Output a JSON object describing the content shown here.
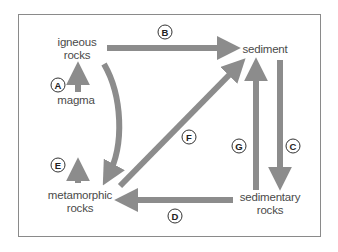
{
  "diagram": {
    "colors": {
      "arrow": "#8c8c8c",
      "frame": "#8a8a8a",
      "text": "#4a4a4a",
      "badge_border": "#333333"
    },
    "nodes": {
      "igneous": {
        "line1": "igneous",
        "line2": "rocks"
      },
      "sediment": {
        "line1": "sediment"
      },
      "magma": {
        "line1": "magma"
      },
      "metamorphic": {
        "line1": "metamorphic",
        "line2": "rocks"
      },
      "sedimentary": {
        "line1": "sedimentary",
        "line2": "rocks"
      }
    },
    "arrows": [
      {
        "label": "A",
        "from": "magma",
        "to": "igneous rocks"
      },
      {
        "label": "B",
        "from": "igneous rocks",
        "to": "sediment"
      },
      {
        "label": "C",
        "from": "sediment",
        "to": "sedimentary rocks"
      },
      {
        "label": "D",
        "from": "sedimentary rocks",
        "to": "metamorphic rocks"
      },
      {
        "label": "E",
        "from": "metamorphic rocks",
        "to": "magma"
      },
      {
        "label": "F",
        "from": "metamorphic rocks",
        "to": "sediment"
      },
      {
        "label": "G",
        "from": "sedimentary rocks",
        "to": "sediment"
      },
      {
        "label": "",
        "from": "igneous rocks",
        "to": "metamorphic rocks",
        "shape": "curved"
      }
    ]
  }
}
